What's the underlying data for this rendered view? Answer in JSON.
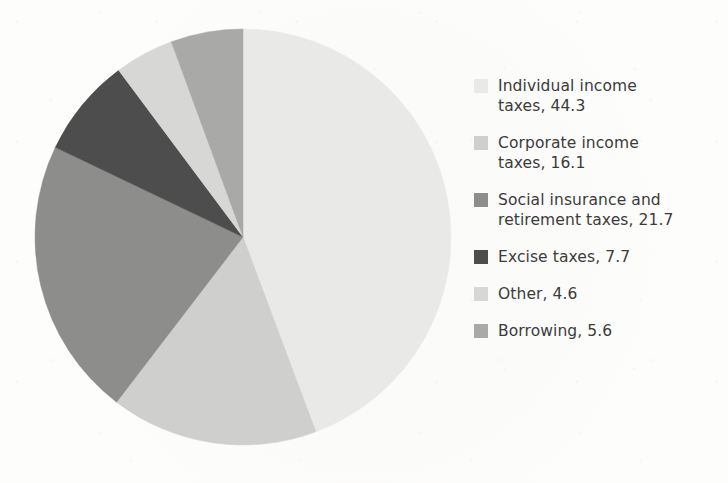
{
  "chart_data": {
    "type": "pie",
    "title": "",
    "subtitle": "",
    "xlabel": "",
    "ylabel": "",
    "units": "percent",
    "total": 100.0,
    "legend_position": "right",
    "grid": false,
    "start_angle_deg": 0,
    "direction": "clockwise",
    "categories": [
      "Individual income taxes",
      "Corporate income taxes",
      "Social insurance and retirement taxes",
      "Excise taxes",
      "Other",
      "Borrowing"
    ],
    "values": [
      44.3,
      16.1,
      21.7,
      7.7,
      4.6,
      5.6
    ],
    "slices": [
      {
        "name": "Individual income taxes",
        "value": 44.3,
        "color": "#e9e9e7",
        "legend_text": "Individual income taxes, 44.3",
        "legend_line1": "Individual income",
        "legend_line2": "taxes, 44.3"
      },
      {
        "name": "Corporate income taxes",
        "value": 16.1,
        "color": "#cfcfcd",
        "legend_text": "Corporate income taxes, 16.1",
        "legend_line1": "Corporate income",
        "legend_line2": "taxes, 16.1"
      },
      {
        "name": "Social insurance and retirement taxes",
        "value": 21.7,
        "color": "#8d8d8b",
        "legend_text": "Social insurance and retirement taxes, 21.7",
        "legend_line1": "Social insurance and",
        "legend_line2": "retirement taxes, 21.7"
      },
      {
        "name": "Excise taxes",
        "value": 7.7,
        "color": "#4d4d4d",
        "legend_text": "Excise taxes, 7.7",
        "legend_line1": "Excise taxes, 7.7",
        "legend_line2": ""
      },
      {
        "name": "Other",
        "value": 4.6,
        "color": "#d7d7d5",
        "legend_text": "Other, 4.6",
        "legend_line1": "Other, 4.6",
        "legend_line2": ""
      },
      {
        "name": "Borrowing",
        "value": 5.6,
        "color": "#a9a9a7",
        "legend_text": "Borrowing, 5.6",
        "legend_line1": "Borrowing, 5.6",
        "legend_line2": ""
      }
    ]
  },
  "geometry": {
    "center_x": 243,
    "center_y": 237,
    "radius": 208
  },
  "colors": {
    "background": "#fdfdfc",
    "text": "#3b3b3b"
  }
}
